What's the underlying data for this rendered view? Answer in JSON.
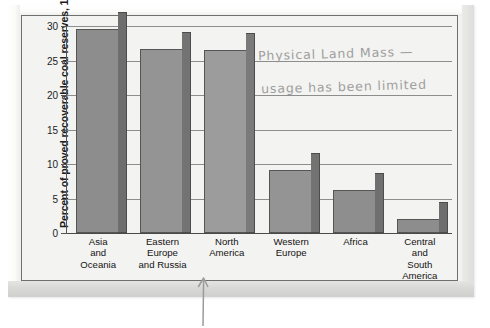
{
  "document": {
    "type": "scanned-textbook-page",
    "annotation_color": "#9a9a9a"
  },
  "chart_data": {
    "type": "bar",
    "title": "",
    "xlabel": "",
    "ylabel": "Percent of proved recoverable coal reserves, 1997",
    "ylim": [
      0,
      30
    ],
    "yticks": [
      0,
      5,
      10,
      15,
      20,
      25,
      30
    ],
    "ytick_labels": [
      "0",
      "5",
      "10",
      "15",
      "20",
      "25",
      "30"
    ],
    "grid": true,
    "legend": "none",
    "categories": [
      "Asia and Oceania",
      "Eastern Europe and Russia",
      "North America",
      "Western Europe",
      "Africa",
      "Central and South America"
    ],
    "category_lines": [
      [
        "Asia",
        "and",
        "Oceania"
      ],
      [
        "Eastern",
        "Europe",
        "and Russia"
      ],
      [
        "North",
        "America"
      ],
      [
        "Western",
        "Europe"
      ],
      [
        "Africa"
      ],
      [
        "Central",
        "and",
        "South",
        "America"
      ]
    ],
    "values": [
      29.5,
      26.7,
      26.5,
      9.1,
      6.2,
      2.0
    ],
    "bar_colors": [
      "#8d8d8d",
      "#949494",
      "#9c9c9c",
      "#949494",
      "#8e8e8e",
      "#8d8d8d"
    ],
    "bar_side_colors": [
      "#6e6e6e",
      "#737373",
      "#7a7a7a",
      "#737373",
      "#6f6f6f",
      "#6e6e6e"
    ]
  },
  "annotations": {
    "handwriting_line_1": "Physical Land Mass —",
    "handwriting_line_2": "usage has been limited",
    "arrow_target": "North America",
    "arrow_icon": "up-arrow-icon"
  }
}
